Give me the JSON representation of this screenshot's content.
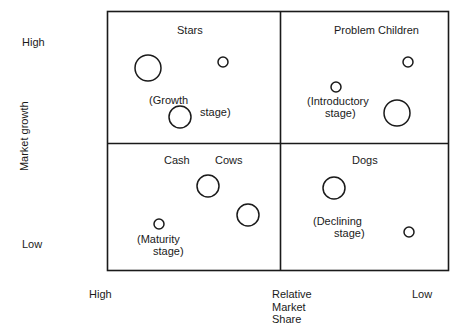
{
  "diagram": {
    "type": "bcg-growth-share-matrix",
    "frame": {
      "x": 107,
      "y": 11,
      "width": 341,
      "height": 259,
      "divider_x": 280,
      "divider_y": 143,
      "stroke": "#1a1a1a"
    }
  },
  "axes": {
    "y": {
      "title": "Market growth",
      "high_label": "High",
      "low_label": "Low"
    },
    "x": {
      "title": "Relative\nMarket\nShare",
      "title_line1": "Relative",
      "title_line2": "Market",
      "title_line3": "Share",
      "high_label": "High",
      "low_label": "Low"
    }
  },
  "quadrants": [
    {
      "key": "stars",
      "title": "Stars",
      "stage_line1": "(Growth",
      "stage_line2": "stage)",
      "bubbles": [
        {
          "cx": 148,
          "cy": 68,
          "r": 13
        },
        {
          "cx": 223,
          "cy": 62,
          "r": 5
        },
        {
          "cx": 180,
          "cy": 117,
          "r": 11
        }
      ]
    },
    {
      "key": "problem-children",
      "title": "Problem Children",
      "stage_line1": "(Introductory",
      "stage_line2": "stage)",
      "bubbles": [
        {
          "cx": 408,
          "cy": 62,
          "r": 5
        },
        {
          "cx": 336,
          "cy": 87,
          "r": 5
        },
        {
          "cx": 397,
          "cy": 113,
          "r": 13
        }
      ]
    },
    {
      "key": "cash-cows",
      "title_word1": "Cash",
      "title_word2": "Cows",
      "stage_line1": "(Maturity",
      "stage_line2": "stage)",
      "bubbles": [
        {
          "cx": 208,
          "cy": 186,
          "r": 11
        },
        {
          "cx": 248,
          "cy": 215,
          "r": 11
        },
        {
          "cx": 159,
          "cy": 224,
          "r": 5
        }
      ]
    },
    {
      "key": "dogs",
      "title": "Dogs",
      "stage_line1": "(Declining",
      "stage_line2": "stage)",
      "bubbles": [
        {
          "cx": 334,
          "cy": 188,
          "r": 11
        },
        {
          "cx": 409,
          "cy": 232,
          "r": 5
        }
      ]
    }
  ]
}
